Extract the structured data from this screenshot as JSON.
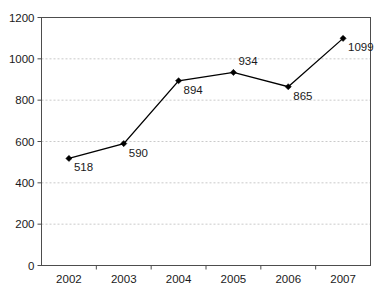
{
  "chart_data": {
    "type": "line",
    "title": "",
    "subtitle": "",
    "xlabel": "",
    "ylabel": "",
    "categories": [
      "2002",
      "2003",
      "2004",
      "2005",
      "2006",
      "2007"
    ],
    "values": [
      518,
      590,
      894,
      934,
      865,
      1099
    ],
    "point_labels": [
      "518",
      "590",
      "894",
      "934",
      "865",
      "1099"
    ],
    "label_positions": [
      "below-right",
      "below-right",
      "below-right",
      "above-right",
      "below-right",
      "below-right"
    ],
    "ylim": [
      0,
      1200
    ],
    "yticks": [
      0,
      200,
      400,
      600,
      800,
      1000,
      1200
    ],
    "ytick_labels": [
      "0",
      "200",
      "400",
      "600",
      "800",
      "1000",
      "1200"
    ],
    "grid": "horizontal-dotted",
    "legend": "none",
    "series": [
      {
        "name": "",
        "values": [
          518,
          590,
          894,
          934,
          865,
          1099
        ],
        "marker": "diamond",
        "color": "#000000"
      }
    ],
    "colors": {
      "line": "#000000",
      "marker": "#000000",
      "grid": "#bdbdbd",
      "axis": "#4d4d4d",
      "text": "#1a1a1a",
      "background": "#ffffff"
    }
  }
}
